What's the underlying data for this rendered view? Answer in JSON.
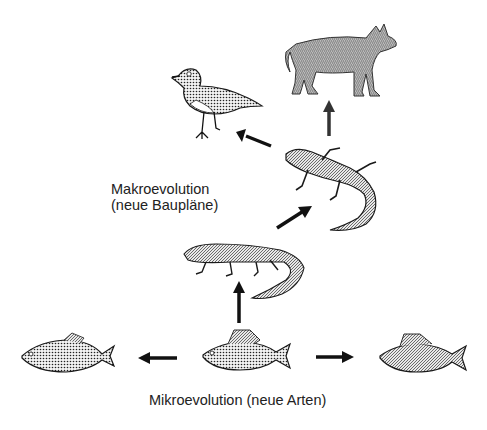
{
  "diagram": {
    "labels": {
      "macro_line1": "Makroevolution",
      "macro_line2": "(neue Baupläne)",
      "micro": "Mikroevolution (neue Arten)"
    },
    "nodes": [
      {
        "id": "bird",
        "name": "Vogel"
      },
      {
        "id": "wolf",
        "name": "Wolf"
      },
      {
        "id": "lizard",
        "name": "Eidechse"
      },
      {
        "id": "amphibian",
        "name": "Amphibium"
      },
      {
        "id": "fish-left",
        "name": "Fisch"
      },
      {
        "id": "fish-center",
        "name": "Barsch"
      },
      {
        "id": "fish-right",
        "name": "Barsch"
      }
    ],
    "edges": [
      {
        "from": "fish-center",
        "to": "fish-left"
      },
      {
        "from": "fish-center",
        "to": "fish-right"
      },
      {
        "from": "fish-center",
        "to": "amphibian"
      },
      {
        "from": "amphibian",
        "to": "lizard"
      },
      {
        "from": "lizard",
        "to": "bird"
      },
      {
        "from": "lizard",
        "to": "wolf"
      }
    ],
    "colors": {
      "ink": "#1a1a1a",
      "background": "#ffffff",
      "shade": "#777777"
    }
  }
}
